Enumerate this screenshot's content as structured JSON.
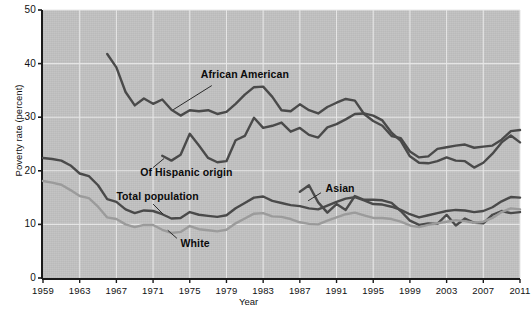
{
  "chart_data": {
    "type": "line",
    "title": "",
    "xlabel": "Year",
    "ylabel": "Poverty rate (percent)",
    "xlim": [
      1959,
      2011
    ],
    "ylim": [
      0,
      50
    ],
    "grid": true,
    "legend_position": "inline-annotations",
    "y_ticks": [
      0,
      10,
      20,
      30,
      40,
      50
    ],
    "y_tick_labels": [
      "0",
      "10",
      "20",
      "30",
      "40",
      "50"
    ],
    "x_ticks": [
      1959,
      1963,
      1967,
      1971,
      1975,
      1979,
      1983,
      1987,
      1991,
      1995,
      1999,
      2003,
      2007,
      2011
    ],
    "x_tick_labels": [
      "1959",
      "1963",
      "1967",
      "1971",
      "1975",
      "1979",
      "1983",
      "1987",
      "1991",
      "1995",
      "1999",
      "2003",
      "2007",
      "2011"
    ],
    "colors": {
      "plot_background": "#c2c2c2",
      "gridline": "#e8e8e8",
      "dark_series": "#4a4a4a",
      "light_series": "#9b9b9b",
      "axis": "#1a1a1a",
      "text": "#111111"
    },
    "series": [
      {
        "name": "African American",
        "color": "#4a4a4a",
        "label_x": 1976.2,
        "label_y": 37.8,
        "leader_from": [
          1977.4,
          35.9
        ],
        "leader_to": [
          1973.2,
          31.4
        ],
        "x": [
          1966,
          1967,
          1968,
          1969,
          1970,
          1971,
          1972,
          1973,
          1974,
          1975,
          1976,
          1977,
          1978,
          1979,
          1980,
          1981,
          1982,
          1983,
          1984,
          1985,
          1986,
          1987,
          1988,
          1989,
          1990,
          1991,
          1992,
          1993,
          1994,
          1995,
          1996,
          1997,
          1998,
          1999,
          2000,
          2001,
          2002,
          2003,
          2004,
          2005,
          2006,
          2007,
          2008,
          2009,
          2010,
          2011
        ],
        "values": [
          41.8,
          39.3,
          34.7,
          32.2,
          33.5,
          32.5,
          33.3,
          31.4,
          30.3,
          31.3,
          31.1,
          31.3,
          30.6,
          31.0,
          32.5,
          34.2,
          35.6,
          35.7,
          33.8,
          31.3,
          31.1,
          32.4,
          31.3,
          30.7,
          31.9,
          32.7,
          33.4,
          33.1,
          30.6,
          29.3,
          28.4,
          26.5,
          26.1,
          23.6,
          22.5,
          22.7,
          24.1,
          24.4,
          24.7,
          24.9,
          24.3,
          24.5,
          24.7,
          25.8,
          27.4,
          27.6
        ]
      },
      {
        "name": "Of Hispanic origin",
        "color": "#4a4a4a",
        "label_x": 1969.6,
        "label_y": 19.6,
        "leader_from": [
          1971.0,
          20.6
        ],
        "leader_to": [
          1972.2,
          22.3
        ],
        "x": [
          1972,
          1973,
          1974,
          1975,
          1976,
          1977,
          1978,
          1979,
          1980,
          1981,
          1982,
          1983,
          1984,
          1985,
          1986,
          1987,
          1988,
          1989,
          1990,
          1991,
          1992,
          1993,
          1994,
          1995,
          1996,
          1997,
          1998,
          1999,
          2000,
          2001,
          2002,
          2003,
          2004,
          2005,
          2006,
          2007,
          2008,
          2009,
          2010,
          2011
        ],
        "values": [
          22.8,
          21.9,
          23.0,
          26.9,
          24.7,
          22.4,
          21.6,
          21.8,
          25.7,
          26.5,
          29.9,
          28.0,
          28.4,
          29.0,
          27.3,
          28.0,
          26.7,
          26.2,
          28.1,
          28.7,
          29.6,
          30.6,
          30.7,
          30.3,
          29.4,
          27.1,
          25.6,
          22.7,
          21.5,
          21.4,
          21.8,
          22.5,
          21.9,
          21.8,
          20.6,
          21.5,
          23.2,
          25.3,
          26.6,
          25.3
        ]
      },
      {
        "name": "Asian",
        "color": "#4a4a4a",
        "label_x": 1989.8,
        "label_y": 16.6,
        "leader_from": [
          1989.3,
          15.9
        ],
        "leader_to": [
          1987.9,
          14.4
        ],
        "x": [
          1987,
          1988,
          1989,
          1990,
          1991,
          1992,
          1993,
          1994,
          1995,
          1996,
          1997,
          1998,
          1999,
          2000,
          2001,
          2002,
          2003,
          2004,
          2005,
          2006,
          2007,
          2008,
          2009,
          2010,
          2011
        ],
        "values": [
          16.1,
          17.3,
          14.1,
          12.2,
          13.8,
          12.7,
          15.3,
          14.6,
          14.6,
          14.5,
          14.0,
          12.5,
          10.7,
          9.9,
          10.2,
          10.1,
          11.8,
          9.8,
          11.1,
          10.3,
          10.2,
          11.8,
          12.5,
          12.1,
          12.3
        ]
      },
      {
        "name": "Total population",
        "color": "#4a4a4a",
        "label_x": 1967.0,
        "label_y": 15.2,
        "leader_from": [
          1971.0,
          13.8
        ],
        "leader_to": [
          1972.1,
          11.9
        ],
        "x": [
          1959,
          1960,
          1961,
          1962,
          1963,
          1964,
          1965,
          1966,
          1967,
          1968,
          1969,
          1970,
          1971,
          1972,
          1973,
          1974,
          1975,
          1976,
          1977,
          1978,
          1979,
          1980,
          1981,
          1982,
          1983,
          1984,
          1985,
          1986,
          1987,
          1988,
          1989,
          1990,
          1991,
          1992,
          1993,
          1994,
          1995,
          1996,
          1997,
          1998,
          1999,
          2000,
          2001,
          2002,
          2003,
          2004,
          2005,
          2006,
          2007,
          2008,
          2009,
          2010,
          2011
        ],
        "values": [
          22.4,
          22.2,
          21.9,
          21.0,
          19.5,
          19.0,
          17.3,
          14.7,
          14.2,
          12.8,
          12.1,
          12.6,
          12.5,
          11.9,
          11.1,
          11.2,
          12.3,
          11.8,
          11.6,
          11.4,
          11.7,
          13.0,
          14.0,
          15.0,
          15.2,
          14.4,
          14.0,
          13.6,
          13.4,
          13.0,
          12.8,
          13.5,
          14.2,
          14.8,
          15.1,
          14.5,
          13.8,
          13.7,
          13.3,
          12.7,
          11.9,
          11.3,
          11.7,
          12.1,
          12.5,
          12.7,
          12.6,
          12.3,
          12.5,
          13.2,
          14.3,
          15.1,
          15.0
        ]
      },
      {
        "name": "White",
        "color": "#9b9b9b",
        "label_x": 1974.0,
        "label_y": 6.4,
        "leader_from": [
          1973.6,
          7.4
        ],
        "leader_to": [
          1972.6,
          8.9
        ],
        "x": [
          1959,
          1960,
          1961,
          1962,
          1963,
          1964,
          1965,
          1966,
          1967,
          1968,
          1969,
          1970,
          1971,
          1972,
          1973,
          1974,
          1975,
          1976,
          1977,
          1978,
          1979,
          1980,
          1981,
          1982,
          1983,
          1984,
          1985,
          1986,
          1987,
          1988,
          1989,
          1990,
          1991,
          1992,
          1993,
          1994,
          1995,
          1996,
          1997,
          1998,
          1999,
          2000,
          2001,
          2002,
          2003,
          2004,
          2005,
          2006,
          2007,
          2008,
          2009,
          2010,
          2011
        ],
        "values": [
          18.1,
          17.8,
          17.4,
          16.4,
          15.3,
          14.9,
          13.3,
          11.3,
          11.0,
          10.0,
          9.5,
          9.9,
          9.9,
          9.0,
          8.4,
          8.6,
          9.7,
          9.1,
          8.9,
          8.7,
          9.0,
          10.2,
          11.1,
          12.0,
          12.1,
          11.5,
          11.4,
          11.0,
          10.4,
          10.1,
          10.0,
          10.7,
          11.3,
          11.9,
          12.2,
          11.7,
          11.2,
          11.2,
          11.0,
          10.5,
          9.8,
          9.5,
          9.9,
          10.2,
          10.5,
          10.8,
          10.6,
          10.3,
          10.5,
          11.2,
          12.3,
          13.0,
          12.8
        ]
      }
    ]
  },
  "annotations": {
    "african_american": "African American",
    "hispanic": "Of Hispanic origin",
    "asian": "Asian",
    "total_population": "Total population",
    "white": "White"
  }
}
